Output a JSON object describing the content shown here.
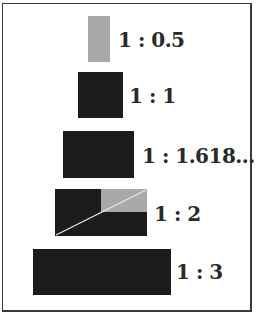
{
  "figure": {
    "colors": {
      "dark": "#1c1c1c",
      "gray": "#a9a9a9",
      "line": "#e6e6e6",
      "text": "#2a2a2a",
      "border": "#3a3a3a"
    },
    "items": [
      {
        "ratio": "1 : 0.5",
        "fill": "gray"
      },
      {
        "ratio": "1 : 1",
        "fill": "dark"
      },
      {
        "ratio": "1 : 1.618.....",
        "fill": "dark"
      },
      {
        "ratio": "1 : 2",
        "fill": "dark",
        "note": "gray upper-right quadrant with diagonal"
      },
      {
        "ratio": "1 : 3",
        "fill": "dark"
      }
    ]
  }
}
